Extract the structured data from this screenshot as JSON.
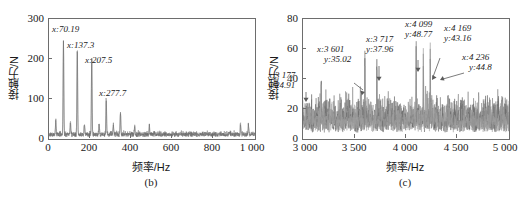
{
  "figure": {
    "panels": [
      {
        "caption": "(b)",
        "xlabel": "频率/Hz",
        "ylabel": "接触力/N",
        "xticks": [
          "0",
          "200",
          "400",
          "600",
          "800",
          "1 000"
        ],
        "yticks": [
          "0",
          "100",
          "200",
          "300"
        ],
        "annotations": [
          {
            "x_label": "x:70.19",
            "y_label": ""
          },
          {
            "x_label": "x:137.3",
            "y_label": ""
          },
          {
            "x_label": "x:207.5",
            "y_label": ""
          },
          {
            "x_label": "x:277.7",
            "y_label": ""
          }
        ]
      },
      {
        "caption": "(c)",
        "xlabel": "频率/Hz",
        "ylabel": "接触力/N",
        "xticks": [
          "3 000",
          "3 500",
          "4 000",
          "4 500",
          "5 000"
        ],
        "yticks": [
          "0",
          "20",
          "40",
          "60",
          "80"
        ],
        "annotations": [
          {
            "x_label": "x:3 177",
            "y_label": "y:24.91"
          },
          {
            "x_label": "x:3 601",
            "y_label": "y:35.02"
          },
          {
            "x_label": "x:3 717",
            "y_label": "y:37.96"
          },
          {
            "x_label": "x:4 099",
            "y_label": "y:48.77"
          },
          {
            "x_label": "x:4 169",
            "y_label": "y:43.16"
          },
          {
            "x_label": "x:4 236",
            "y_label": "y:44.8"
          }
        ]
      }
    ]
  },
  "colors": {
    "trace": "#8c8c8c",
    "trace_dark": "#6b6b6b",
    "axis": "#6d6d6d",
    "text": "#1a1a1a",
    "background": "#ffffff"
  },
  "chart_data": [
    {
      "type": "line",
      "title": "(b)",
      "subtitle": "",
      "xlabel": "频率/Hz",
      "ylabel": "接触力/N",
      "xlim": [
        0,
        1000
      ],
      "ylim": [
        0,
        300
      ],
      "xticks": [
        0,
        200,
        400,
        600,
        800,
        1000
      ],
      "yticks": [
        0,
        100,
        200,
        300
      ],
      "grid": false,
      "legend": "none",
      "series": [
        {
          "name": "接触力频谱",
          "baseline": 14,
          "peaks": [
            {
              "x": 70.19,
              "y": 235,
              "label": "x:70.19"
            },
            {
              "x": 137.3,
              "y": 222,
              "label": "x:137.3"
            },
            {
              "x": 207.5,
              "y": 196,
              "label": "x:207.5"
            },
            {
              "x": 277.7,
              "y": 88,
              "label": "x:277.7"
            },
            {
              "x": 347.0,
              "y": 56,
              "label": ""
            },
            {
              "x": 33.0,
              "y": 36,
              "label": ""
            },
            {
              "x": 104.0,
              "y": 30,
              "label": ""
            },
            {
              "x": 172.0,
              "y": 27,
              "label": ""
            },
            {
              "x": 243.0,
              "y": 26,
              "label": ""
            },
            {
              "x": 312.0,
              "y": 24,
              "label": ""
            },
            {
              "x": 416.0,
              "y": 22,
              "label": ""
            },
            {
              "x": 487.0,
              "y": 20,
              "label": ""
            },
            {
              "x": 930.0,
              "y": 26,
              "label": ""
            },
            {
              "x": 968.0,
              "y": 24,
              "label": ""
            }
          ]
        }
      ]
    },
    {
      "type": "line",
      "title": "(c)",
      "subtitle": "",
      "xlabel": "频率/Hz",
      "ylabel": "接触力/N",
      "xlim": [
        3000,
        5000
      ],
      "ylim": [
        0,
        80
      ],
      "xticks": [
        3000,
        3500,
        4000,
        4500,
        5000
      ],
      "yticks": [
        0,
        20,
        40,
        60,
        80
      ],
      "grid": false,
      "legend": "none",
      "series": [
        {
          "name": "接触力频谱",
          "baseline": 12,
          "peaks": [
            {
              "x": 3177,
              "y": 24.91,
              "label": "x:3 177 / y:24.91"
            },
            {
              "x": 3601,
              "y": 35.02,
              "label": "x:3 601 / y:35.02"
            },
            {
              "x": 3717,
              "y": 37.96,
              "label": "x:3 717 / y:37.96"
            },
            {
              "x": 4099,
              "y": 48.77,
              "label": "x:4 099 / y:48.77"
            },
            {
              "x": 4169,
              "y": 43.16,
              "label": "x:4 169 / y:43.16"
            },
            {
              "x": 4236,
              "y": 44.8,
              "label": "x:4 236 / y:44.8"
            }
          ]
        }
      ]
    }
  ]
}
